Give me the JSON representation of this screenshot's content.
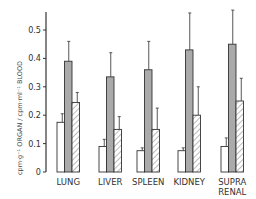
{
  "chart_data": {
    "type": "bar",
    "title": "",
    "xlabel": "",
    "ylabel": "cpm·g⁻¹ ORGAN / cpm·ml⁻¹ BLOOD",
    "ylim": [
      0,
      0.55
    ],
    "yticks": [
      "0",
      "0.1",
      "0.2",
      "0.3",
      "0.4",
      "0.5"
    ],
    "grid": false,
    "legend": null,
    "categories": [
      "LUNG",
      "LIVER",
      "SPLEEN",
      "KIDNEY",
      "SUPRA RENAL"
    ],
    "category_lines": [
      [
        "LUNG"
      ],
      [
        "LIVER"
      ],
      [
        "SPLEEN"
      ],
      [
        "KIDNEY"
      ],
      [
        "SUPRA",
        "RENAL"
      ]
    ],
    "series": [
      {
        "name": "series 1 (open)",
        "style": "white",
        "values": [
          0.175,
          0.09,
          0.075,
          0.075,
          0.09
        ],
        "error": [
          0.03,
          0.025,
          0.01,
          0.01,
          0.03
        ]
      },
      {
        "name": "series 2 (shaded)",
        "style": "gray",
        "values": [
          0.39,
          0.335,
          0.36,
          0.43,
          0.45
        ],
        "error": [
          0.07,
          0.085,
          0.1,
          0.13,
          0.12
        ]
      },
      {
        "name": "series 3 (hatched)",
        "style": "hatched",
        "values": [
          0.245,
          0.15,
          0.15,
          0.2,
          0.25
        ],
        "error": [
          0.035,
          0.045,
          0.075,
          0.1,
          0.08
        ]
      }
    ]
  }
}
